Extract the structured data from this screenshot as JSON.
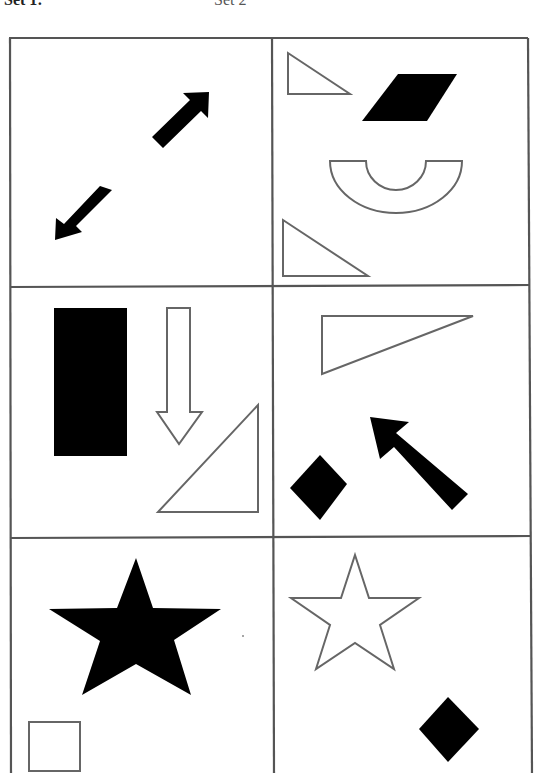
{
  "header": {
    "left_label": "Set 1:",
    "right_label": "Set 2"
  },
  "grid": {
    "rows": 3,
    "columns": 2,
    "line_color": "#555555",
    "fill_color": "#000000",
    "outline_color": "#666666"
  },
  "panels": [
    {
      "id": "r1c1",
      "shapes": [
        {
          "type": "arrow",
          "fill": "solid",
          "direction": "up-right"
        },
        {
          "type": "arrow",
          "fill": "solid",
          "direction": "down-left"
        }
      ]
    },
    {
      "id": "r1c2",
      "shapes": [
        {
          "type": "right-triangle",
          "fill": "outline",
          "position": "top-left",
          "size": "small"
        },
        {
          "type": "parallelogram",
          "fill": "solid",
          "position": "top-right"
        },
        {
          "type": "half-ring",
          "fill": "outline",
          "position": "center"
        },
        {
          "type": "right-triangle",
          "fill": "outline",
          "position": "bottom-left"
        }
      ]
    },
    {
      "id": "r2c1",
      "shapes": [
        {
          "type": "rectangle",
          "fill": "solid",
          "orientation": "vertical"
        },
        {
          "type": "arrow",
          "fill": "outline",
          "direction": "down"
        },
        {
          "type": "right-triangle",
          "fill": "outline",
          "position": "bottom-right"
        }
      ]
    },
    {
      "id": "r2c2",
      "shapes": [
        {
          "type": "right-triangle",
          "fill": "outline",
          "position": "top"
        },
        {
          "type": "diamond",
          "fill": "solid",
          "position": "bottom-left"
        },
        {
          "type": "arrow",
          "fill": "solid",
          "direction": "up-left"
        }
      ]
    },
    {
      "id": "r3c1",
      "shapes": [
        {
          "type": "star",
          "fill": "solid",
          "size": "large"
        },
        {
          "type": "square",
          "fill": "outline",
          "position": "bottom-left",
          "size": "small"
        }
      ]
    },
    {
      "id": "r3c2",
      "shapes": [
        {
          "type": "star",
          "fill": "outline",
          "size": "medium"
        },
        {
          "type": "diamond",
          "fill": "solid",
          "position": "bottom-right"
        }
      ]
    }
  ]
}
